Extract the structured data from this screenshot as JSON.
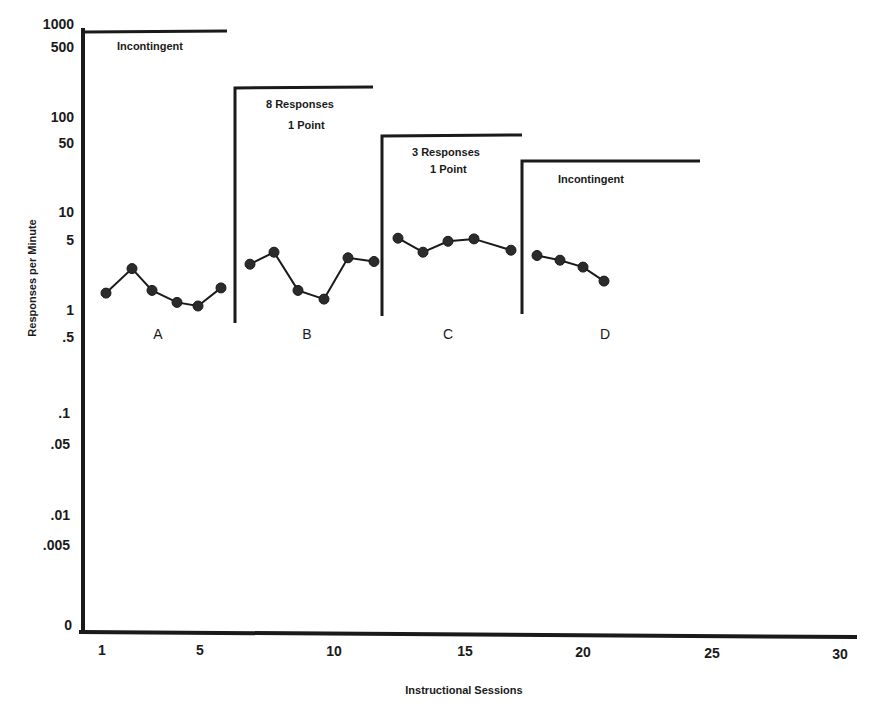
{
  "chart_data": {
    "type": "line",
    "title": "",
    "xlabel": "Instructional Sessions",
    "ylabel": "Responses per Minute",
    "y_scale": "log",
    "x_ticks": [
      "1",
      "5",
      "10",
      "15",
      "20",
      "25",
      "30"
    ],
    "y_ticks": [
      "1000",
      "500",
      "100",
      "50",
      "10",
      "5",
      "1",
      ".5",
      ".1",
      ".05",
      ".01",
      ".005",
      "0"
    ],
    "xlim": [
      1,
      30
    ],
    "ylim": [
      0,
      1000
    ],
    "grid": false,
    "legend": null,
    "phases": [
      {
        "label": "A",
        "condition": [
          "Incontingent"
        ],
        "sessions": [
          1,
          2,
          3,
          4,
          5,
          6
        ],
        "values": [
          1.5,
          2.7,
          1.6,
          1.2,
          1.1,
          1.7
        ]
      },
      {
        "label": "B",
        "condition": [
          "8 Responses",
          "1 Point"
        ],
        "sessions": [
          7,
          8,
          9,
          10,
          11,
          12
        ],
        "values": [
          3.0,
          4.0,
          1.6,
          1.3,
          3.5,
          3.2
        ]
      },
      {
        "label": "C",
        "condition": [
          "3 Responses",
          "1 Point"
        ],
        "sessions": [
          13,
          14,
          15,
          16,
          17
        ],
        "values": [
          5.6,
          4.0,
          5.2,
          5.5,
          4.2
        ]
      },
      {
        "label": "D",
        "condition": [
          "Incontingent"
        ],
        "sessions": [
          18,
          19,
          20,
          21
        ],
        "values": [
          3.7,
          3.3,
          2.8,
          2.0
        ]
      }
    ]
  },
  "labels": {
    "y_axis_title": "Responses per Minute",
    "x_axis_title": "Instructional Sessions",
    "phase_a": "A",
    "phase_b": "B",
    "phase_c": "C",
    "phase_d": "D",
    "cond_a": "Incontingent",
    "cond_b_line1": "8 Responses",
    "cond_b_line2": "1 Point",
    "cond_c_line1": "3 Responses",
    "cond_c_line2": "1 Point",
    "cond_d": "Incontingent",
    "yticks": [
      "1000",
      "500",
      "100",
      "50",
      "10",
      "5",
      "1",
      ".5",
      ".1",
      ".05",
      ".01",
      ".005",
      "0"
    ],
    "xticks": [
      "1",
      "5",
      "10",
      "15",
      "20",
      "25",
      "30"
    ]
  },
  "colors": {
    "ink": "#1a1a1a",
    "background": "#ffffff"
  }
}
